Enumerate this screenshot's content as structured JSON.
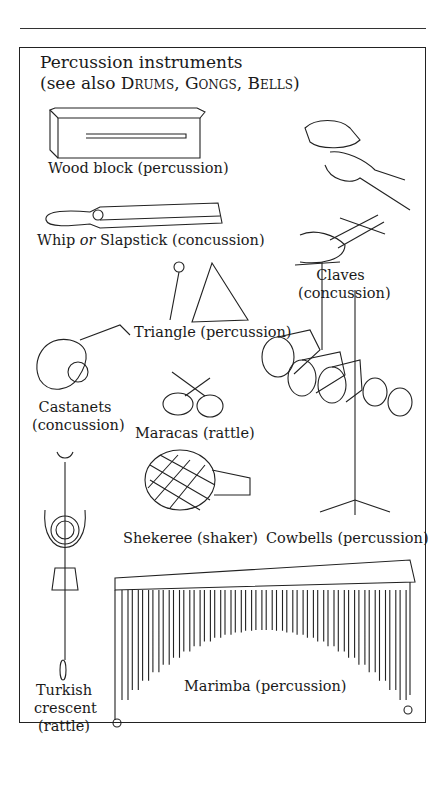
{
  "heading": {
    "line1": "Percussion instruments",
    "see_also_prefix": "(see also ",
    "refs": [
      "Drums",
      "Gongs",
      "Bells"
    ],
    "sep": ", ",
    "suffix": ")"
  },
  "labels": {
    "wood_block": "Wood block (percussion)",
    "whip_a": "Whip ",
    "whip_or": "or",
    "whip_b": " Slapstick (concussion)",
    "claves_1": "Claves",
    "claves_2": "(concussion)",
    "triangle": "Triangle (percussion)",
    "castanets_1": "Castanets",
    "castanets_2": "(concussion)",
    "maracas": "Maracas (rattle)",
    "shekeree": "Shekeree (shaker)",
    "cowbells": "Cowbells (percussion)",
    "turkish_1": "Turkish",
    "turkish_2": "crescent",
    "turkish_3": "(rattle)",
    "marimba": "Marimba (percussion)"
  }
}
